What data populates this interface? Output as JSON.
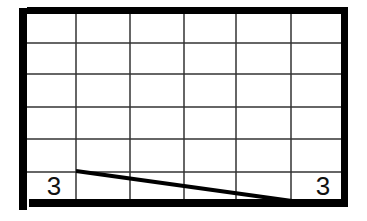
{
  "diagram": {
    "colors": {
      "background": "#ffffff",
      "border": "#000000",
      "grid": "#333333",
      "line": "#000000",
      "label": "#111111"
    },
    "grid": {
      "columns": 6,
      "rows": 6,
      "vertical_lines_x": [
        76,
        130,
        184,
        236,
        291
      ],
      "horizontal_lines_y": [
        43,
        74,
        107,
        139,
        172
      ]
    },
    "border": {
      "left": {
        "x": 19,
        "y": 8,
        "w": 8,
        "h": 202
      },
      "top": {
        "x": 27,
        "y": 7,
        "w": 321,
        "h": 7
      },
      "right": {
        "x": 341,
        "y": 14,
        "w": 7,
        "h": 192
      },
      "bottom": {
        "x": 29,
        "y": 199,
        "w": 319,
        "h": 8
      }
    },
    "sloped_line": {
      "x1": 76,
      "y1": 171,
      "x2": 292,
      "y2": 201,
      "stroke_width": 4
    },
    "labels": [
      {
        "text": "3",
        "position": "bottom-left"
      },
      {
        "text": "3",
        "position": "bottom-right"
      }
    ]
  }
}
